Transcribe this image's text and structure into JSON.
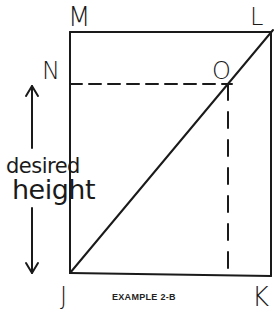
{
  "diagram": {
    "points": {
      "M": "M",
      "L": "L",
      "N": "N",
      "O": "O",
      "J": "J",
      "K": "K"
    },
    "height_label": {
      "line1": "desired",
      "line2": "height"
    },
    "caption": "EXAMPLE 2-B"
  }
}
